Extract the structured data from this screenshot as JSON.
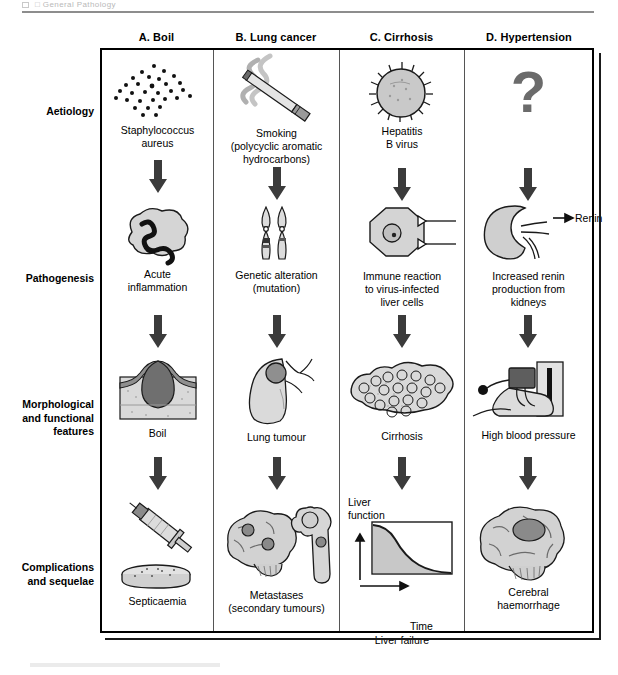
{
  "running_head": "□  General Pathology",
  "figure": {
    "row_labels": [
      {
        "id": "aetiology",
        "text": "Aetiology"
      },
      {
        "id": "pathogenesis",
        "text": "Pathogenesis"
      },
      {
        "id": "morphological",
        "text": "Morphological\nand functional\nfeatures"
      },
      {
        "id": "complications",
        "text": "Complications\nand  sequelae"
      }
    ],
    "columns": [
      {
        "id": "boil",
        "header": "A. Boil",
        "aetiology": {
          "caption": "Staphylococcus\naureus",
          "icon": "bacteria-dots-icon"
        },
        "pathogenesis": {
          "caption": "Acute\ninflammation",
          "icon": "neutrophil-icon"
        },
        "morphology": {
          "caption": "Boil",
          "icon": "skin-boil-section-icon"
        },
        "complications": {
          "caption": "Septicaemia",
          "icon": "syringe-petri-dish-icon"
        }
      },
      {
        "id": "lung-cancer",
        "header": "B. Lung cancer",
        "aetiology": {
          "caption": "Smoking\n(polycyclic aromatic\nhydrocarbons)",
          "icon": "cigarette-smoke-icon"
        },
        "pathogenesis": {
          "caption": "Genetic alteration\n(mutation)",
          "icon": "chromosome-pair-icon"
        },
        "morphology": {
          "caption": "Lung tumour",
          "icon": "lung-tumour-icon"
        },
        "complications": {
          "caption": "Metastases\n(secondary tumours)",
          "icon": "brain-bone-metastases-icon"
        }
      },
      {
        "id": "cirrhosis",
        "header": "C. Cirrhosis",
        "aetiology": {
          "caption": "Hepatitis\nB virus",
          "icon": "virus-particle-icon"
        },
        "pathogenesis": {
          "caption": "Immune reaction\nto virus-infected\nliver cells",
          "icon": "hepatocyte-lymphocyte-icon"
        },
        "morphology": {
          "caption": "Cirrhosis",
          "icon": "nodular-liver-icon"
        },
        "complications": {
          "caption": "Liver failure",
          "icon": "liver-function-graph-icon",
          "graph": {
            "type": "line",
            "y_axis_label": "Liver\nfunction",
            "x_axis_label": "Time",
            "series_name": "Liver function over time",
            "shape": "sigmoid-decline",
            "points": [
              [
                0,
                98
              ],
              [
                12,
                95
              ],
              [
                25,
                88
              ],
              [
                38,
                72
              ],
              [
                50,
                52
              ],
              [
                62,
                34
              ],
              [
                75,
                21
              ],
              [
                88,
                13
              ],
              [
                100,
                9
              ]
            ]
          }
        }
      },
      {
        "id": "hypertension",
        "header": "D. Hypertension",
        "aetiology": {
          "caption": "",
          "icon": "question-mark-icon",
          "symbol": "?"
        },
        "pathogenesis": {
          "caption": "Increased renin\nproduction from\nkidneys",
          "icon": "kidney-renin-icon",
          "annotation": "Renin"
        },
        "morphology": {
          "caption": "High blood pressure",
          "icon": "sphygmomanometer-icon"
        },
        "complications": {
          "caption": "Cerebral\nhaemorrhage",
          "icon": "brain-haemorrhage-icon"
        }
      }
    ]
  },
  "colors": {
    "ink": "#000000",
    "arrow": "#3b3b3b",
    "fill_light": "#d5d5d5",
    "fill_mid": "#b4b4b4",
    "fill_dark": "#8a8a8a",
    "outline": "#1a1a1a"
  }
}
